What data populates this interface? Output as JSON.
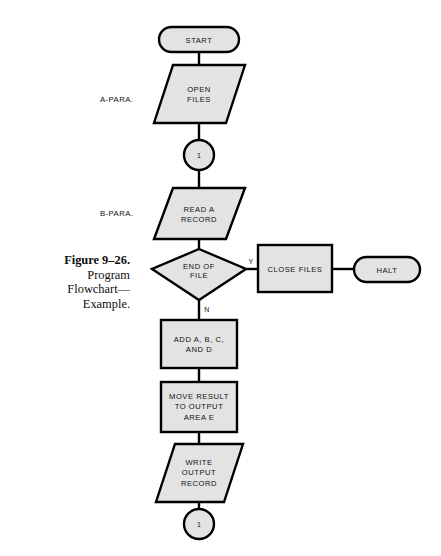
{
  "figure": {
    "caption_lines": [
      "Figure 9–26.",
      "Program",
      "Flowchart—",
      "Example."
    ],
    "caption_bold_line": "Figure 9–26.",
    "colors": {
      "shape_fill": "#e3e3e3",
      "shape_stroke": "#000000",
      "page_background": "#ffffff",
      "text": "#111111"
    }
  },
  "paragraph_labels": [
    {
      "name": "a-para-label",
      "text": "A-PARA."
    },
    {
      "name": "b-para-label",
      "text": "B-PARA."
    }
  ],
  "nodes": {
    "start": {
      "type": "terminator",
      "label": "START"
    },
    "open_files": {
      "type": "input-output",
      "label_line1": "OPEN",
      "label_line2": "FILES"
    },
    "connector_top": {
      "type": "connector",
      "label": "1"
    },
    "read_record": {
      "type": "input-output",
      "label_line1": "READ A",
      "label_line2": "RECORD"
    },
    "end_of_file": {
      "type": "decision",
      "label_line1": "END OF",
      "label_line2": "FILE"
    },
    "close_files": {
      "type": "process",
      "label": "CLOSE FILES"
    },
    "halt": {
      "type": "terminator",
      "label": "HALT"
    },
    "add_abcd": {
      "type": "process",
      "label_line1": "ADD A, B, C,",
      "label_line2": "AND D"
    },
    "move_result": {
      "type": "process",
      "label_line1": "MOVE RESULT",
      "label_line2": "TO OUTPUT",
      "label_line3": "AREA E"
    },
    "write_output": {
      "type": "input-output",
      "label_line1": "WRITE",
      "label_line2": "OUTPUT",
      "label_line3": "RECORD"
    },
    "connector_bottom": {
      "type": "connector",
      "label": "1"
    }
  },
  "branches": {
    "yes": "Y",
    "no": "N"
  }
}
